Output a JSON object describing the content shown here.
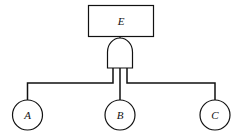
{
  "diagram": {
    "type": "fault-tree",
    "top_event": {
      "label": "E"
    },
    "gate": {
      "type": "AND"
    },
    "basic_events": [
      {
        "label": "A"
      },
      {
        "label": "B"
      },
      {
        "label": "C"
      }
    ]
  }
}
